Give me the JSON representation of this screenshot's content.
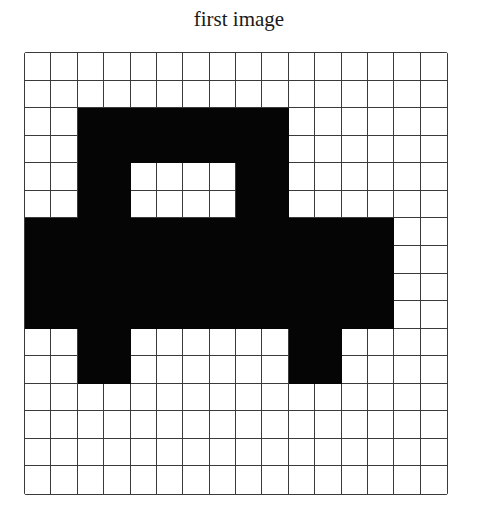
{
  "title": "first image",
  "grid": {
    "rows": 16,
    "cols": 16,
    "fill_color": "#050505",
    "empty_color": "#ffffff",
    "line_color": "#3a3a3a",
    "cells": [
      "0000000000000000",
      "0000000000000000",
      "0011111111000000",
      "0011111111000000",
      "0011000011000000",
      "0011000011000000",
      "1111111111111100",
      "1111111111111100",
      "1111111111111100",
      "1111111111111100",
      "0011000000110000",
      "0011000000110000",
      "0000000000000000",
      "0000000000000000",
      "0000000000000000",
      "0000000000000000"
    ]
  }
}
